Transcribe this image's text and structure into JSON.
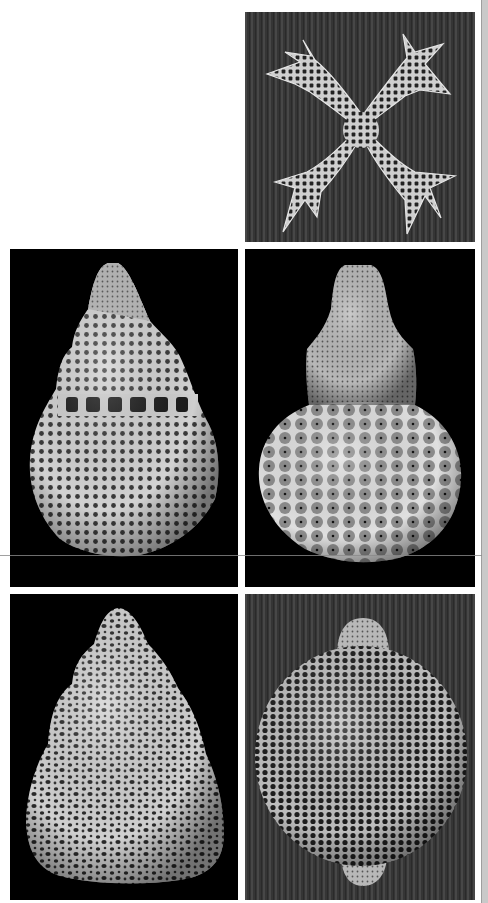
{
  "figure": {
    "background_color": "#ffffff",
    "panels": [
      {
        "id": "top-right",
        "label": "Cross-shaped four-armed lattice skeleton",
        "background": "striated dark grey"
      },
      {
        "id": "middle-left",
        "label": "Conical multi-segmented porous skeleton with spiny rim",
        "background": "black"
      },
      {
        "id": "middle-right",
        "label": "Pear-shaped skeleton with tapered apex and honeycomb globe",
        "background": "black"
      },
      {
        "id": "bottom-left",
        "label": "Conical skeleton with irregular perforated surface",
        "background": "black"
      },
      {
        "id": "bottom-right",
        "label": "Spherical lattice skeleton with polar tubes",
        "background": "striated dark grey"
      }
    ]
  },
  "colors": {
    "specimen": "#d4d4d4",
    "specimen_shadow": "#8c8c8c",
    "pore": "#1a1a1a",
    "striated_bg": "#3a3a3a",
    "edge_strip": "#c9c9c9"
  }
}
